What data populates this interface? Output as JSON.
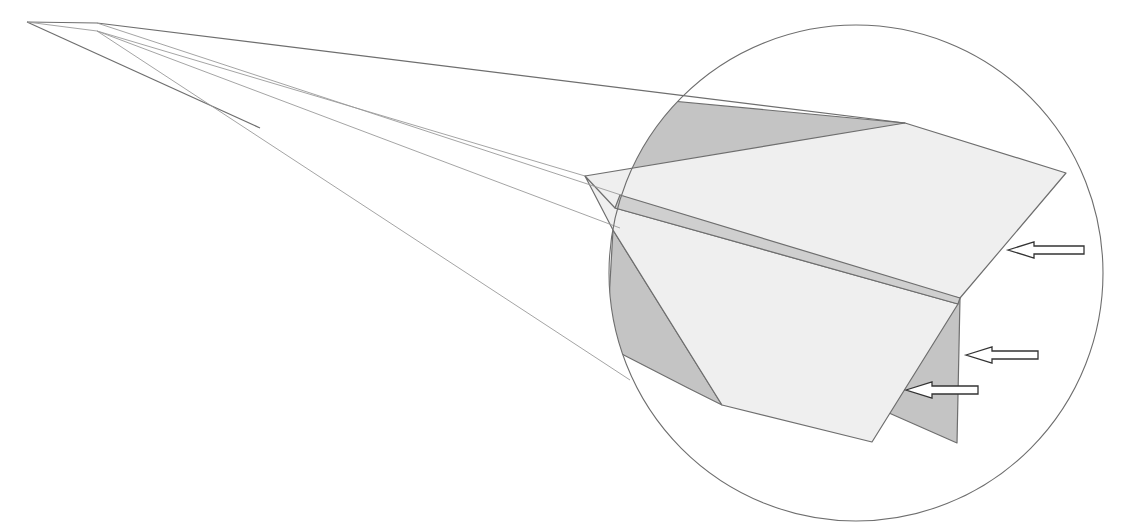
{
  "diagram": {
    "title": "",
    "colors": {
      "background": "#ffffff",
      "line": "#6e6e6e",
      "line_light": "#9a9a9a",
      "paper_light": "#efefef",
      "paper_shadow": "#c4c4c4",
      "keel_strip": "#cfcfcf",
      "arrow_fill": "#ffffff",
      "arrow_stroke": "#333333"
    },
    "magnifier_circle": {
      "cx": 856,
      "cy": 273,
      "rx": 247,
      "ry": 248
    },
    "nose_lines": [
      {
        "name": "upper-edge",
        "points": [
          [
            27,
            22
          ],
          [
            97,
            23
          ],
          [
            905,
            123
          ]
        ]
      },
      {
        "name": "lower-edge",
        "points": [
          [
            27,
            22
          ],
          [
            260,
            128
          ]
        ]
      },
      {
        "name": "inner-fold-1",
        "points": [
          [
            27,
            22
          ],
          [
            97,
            31
          ],
          [
            585,
            176
          ]
        ]
      },
      {
        "name": "inner-fold-2",
        "points": [
          [
            97,
            23
          ],
          [
            624,
            196
          ]
        ]
      },
      {
        "name": "inner-fold-3",
        "points": [
          [
            97,
            31
          ],
          [
            620,
            228
          ]
        ]
      },
      {
        "name": "under-edge",
        "points": [
          [
            97,
            31
          ],
          [
            630,
            380
          ]
        ]
      }
    ],
    "shapes": {
      "top_shadow": [
        [
          640,
          98
        ],
        [
          905,
          123
        ],
        [
          620,
          195
        ]
      ],
      "top_wing": [
        [
          585,
          176
        ],
        [
          905,
          123
        ],
        [
          1066,
          173
        ],
        [
          960,
          298
        ],
        [
          620,
          228
        ]
      ],
      "keel_strip": [
        [
          620,
          195
        ],
        [
          960,
          298
        ],
        [
          958,
          304
        ],
        [
          615,
          208
        ]
      ],
      "lower_wing": [
        [
          585,
          176
        ],
        [
          615,
          208
        ],
        [
          958,
          304
        ],
        [
          872,
          442
        ],
        [
          722,
          405
        ],
        [
          613,
          230
        ]
      ],
      "left_shadow": [
        [
          613,
          230
        ],
        [
          722,
          405
        ],
        [
          688,
          388
        ],
        [
          614,
          350
        ],
        [
          609,
          300
        ]
      ],
      "rear_fin": [
        [
          960,
          298
        ],
        [
          957,
          443
        ],
        [
          889,
          413
        ]
      ]
    },
    "arrows": [
      {
        "name": "arrow-wing-edge",
        "tip": [
          1008,
          250
        ],
        "length": 76
      },
      {
        "name": "arrow-fin-edge",
        "tip": [
          966,
          355
        ],
        "length": 72
      },
      {
        "name": "arrow-lower-edge",
        "tip": [
          906,
          390
        ],
        "length": 72
      }
    ]
  }
}
